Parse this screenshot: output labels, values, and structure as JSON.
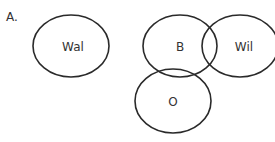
{
  "panel_label": "A.",
  "sets": [
    {
      "id": "wal",
      "label": "Wal",
      "cx": 71,
      "cy": 46,
      "rx": 38,
      "ry": 31
    },
    {
      "id": "b",
      "label": "B",
      "cx": 180,
      "cy": 46,
      "rx": 37,
      "ry": 31
    },
    {
      "id": "wil",
      "label": "Wil",
      "cx": 240,
      "cy": 46,
      "rx": 38,
      "ry": 31
    },
    {
      "id": "o",
      "label": "O",
      "cx": 173,
      "cy": 101,
      "rx": 38,
      "ry": 32
    }
  ],
  "stroke_color": "#2a2a2a"
}
